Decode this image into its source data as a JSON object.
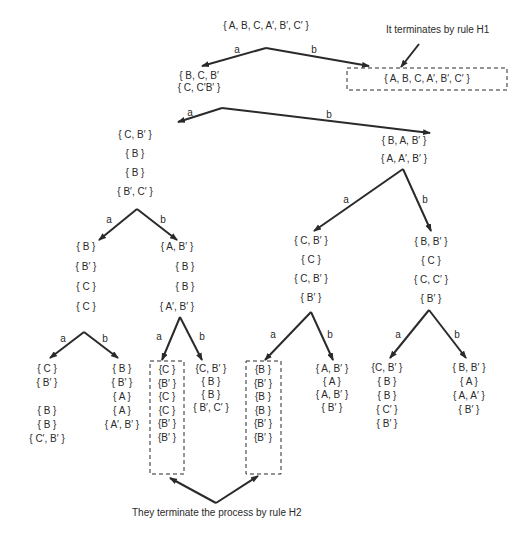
{
  "annotations": {
    "h1": "It terminates by rule H1",
    "h2": "They terminate the process by rule H2"
  },
  "edge_labels": {
    "a": "a",
    "b": "b"
  },
  "nodes": {
    "root": [
      "{ A, B, C, A′, B′, C′ }"
    ],
    "root_b": [
      "{ A, B, C, A′, B′, C′ }"
    ],
    "n1": [
      "{ B, C, B′",
      "{ C, C′B′ }"
    ],
    "n1a": [
      "{ C, B′ }",
      "{ B }",
      "{ B }",
      "{ B′, C′ }"
    ],
    "n1b": [
      "{ B, A, B′ }",
      "{ A, A′, B′ }"
    ],
    "n1aa": [
      "{ B }",
      "{ B′ }",
      "{ C }",
      "{ C }"
    ],
    "n1ab": [
      "{ A, B′ }",
      "{ B }",
      "{ B }",
      "{ A′, B′ }"
    ],
    "n1ba": [
      "{ C, B′ }",
      "{ C }",
      "{ C, B′ }",
      "{ B′ }"
    ],
    "n1bb": [
      "{ B, B′ }",
      "{ C }",
      "{ C, C′ }",
      "{ B′ }"
    ],
    "n1aaa": [
      "{ C }",
      "{ B′ }",
      "",
      "{ B }",
      "{ B }",
      "{ C′, B′ }"
    ],
    "n1aab": [
      "{ B }",
      "{ B′ }",
      "{ A }",
      "{ A }",
      "{ A′, B′ }"
    ],
    "n1aba": [
      "{C }",
      "{B′ }",
      "{C }",
      "{C }",
      "{B′ }",
      "{B′ }"
    ],
    "n1abb": [
      "{C, B′ }",
      "{ B }",
      "{ B }",
      "{ B′, C′ }"
    ],
    "n1baa": [
      "{B }",
      "{B′ }",
      "{B }",
      "{B }",
      "{B′ }",
      "{B′ }"
    ],
    "n1bab": [
      "{ A, B′ }",
      "{ A }",
      "{ A, B′ }",
      "{ B′ }"
    ],
    "n1bba": [
      "{C, B′ }",
      "{ B }",
      "{ B }",
      "{ C′ }",
      "{ B′ }"
    ],
    "n1bbb": [
      "{ B, B′ }",
      "{ A }",
      "{ A, A′ }",
      "{ B′ }"
    ]
  },
  "colors": {
    "ink": "#2a2a2a",
    "background": "#ffffff"
  }
}
